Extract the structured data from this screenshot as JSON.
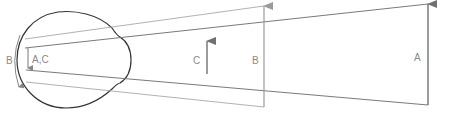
{
  "diagram": {
    "type": "eye-visual-angle",
    "labels": {
      "object_a": "A",
      "object_b": "B",
      "object_c": "C",
      "retina_b": "B",
      "retina_ac": "A,C"
    },
    "colors": {
      "eye_outline": "#333333",
      "ray_light": "#a8a8a8",
      "ray_dark": "#6a6a6a",
      "arrow": "#707070",
      "label": "#8a8a8a"
    },
    "objects": [
      {
        "name": "A",
        "x": 428,
        "y_top": 4,
        "y_bottom": 105
      },
      {
        "name": "B",
        "x": 264,
        "y_top": 6,
        "y_bottom": 107
      },
      {
        "name": "C",
        "x": 207,
        "y_top": 41,
        "y_bottom": 74
      }
    ],
    "nodal_point": {
      "x": 100,
      "y": 59
    }
  }
}
